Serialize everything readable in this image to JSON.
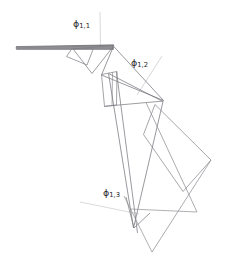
{
  "figure": {
    "type": "technical-line-diagram",
    "background_color": "#ffffff",
    "canvas": {
      "width": 243,
      "height": 273
    },
    "stroke_colors": {
      "primary": "#6e6e73",
      "secondary": "#8a8a90",
      "reference": "#cfcfd4",
      "beam_dark": "#5a5a5f"
    },
    "labels": [
      {
        "id": "phi-1-1",
        "symbol": "ϕ",
        "subscript": "1,1",
        "x": 73,
        "y": 24
      },
      {
        "id": "phi-1-2",
        "symbol": "ϕ",
        "subscript": "1,2",
        "x": 131,
        "y": 62
      },
      {
        "id": "phi-1-3",
        "symbol": "ϕ",
        "subscript": "1,3",
        "x": 104,
        "y": 192
      }
    ],
    "reference_lines": [
      {
        "id": "vertical-ref-top",
        "x1": 100,
        "y1": 12,
        "x2": 100.5,
        "y2": 48,
        "color": "#cfcfd4",
        "width": 0.8
      },
      {
        "id": "angle-ref-2",
        "x1": 160,
        "y1": 58,
        "x2": 139,
        "y2": 92,
        "color": "#d2d2d7",
        "width": 0.8
      },
      {
        "id": "angle-ref-3",
        "x1": 82,
        "y1": 203,
        "x2": 137,
        "y2": 213,
        "color": "#d6d6db",
        "width": 0.8
      }
    ],
    "link_1": {
      "name": "thin-beam-link",
      "description": "long slender beam from left edge to first joint",
      "points": "16,47 113,45 113,49 16,49"
    },
    "joint_1_frame": {
      "name": "first-joint-quadrilateral",
      "points": "72,48 93,48 87,64 67,57"
    },
    "link_2_outline": {
      "name": "second-link-triangle",
      "points": "73,49 113,46 93,73"
    },
    "link_2_body": {
      "name": "second-link-long-triangle",
      "points": "112,47 163,100 102,75"
    },
    "joint_2_frame": {
      "name": "second-joint-quadrilateral",
      "points": "102,74 117,71 116,105 104,106"
    },
    "link_3_body": {
      "name": "third-link-narrow-triangle",
      "points": "109,73 163,101 133,227"
    },
    "link_3_spine": {
      "name": "third-link-spine",
      "points": "116,72 137,233"
    },
    "joint_3_frame": {
      "name": "third-joint-marker",
      "points": "126,198 133,228 149,214"
    },
    "link_4_frame": {
      "name": "fourth-link-parallelogram",
      "points": "155,105 211,160 183,191 144,135"
    },
    "link_4_struts": [
      {
        "id": "strut-a",
        "x1": 147,
        "y1": 103,
        "x2": 196,
        "y2": 212
      },
      {
        "id": "strut-b",
        "x1": 211,
        "y1": 160,
        "x2": 152,
        "y2": 252
      }
    ],
    "crossing_lines": [
      {
        "id": "cross-1",
        "x1": 131,
        "y1": 208,
        "x2": 196,
        "y2": 212
      },
      {
        "id": "cross-2",
        "x1": 124,
        "y1": 196,
        "x2": 152,
        "y2": 252
      }
    ]
  }
}
